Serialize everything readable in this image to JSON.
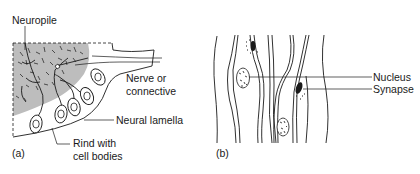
{
  "figure": {
    "panel_a": {
      "panel_label": "(a)",
      "labels": {
        "neuropile": "Neuropile",
        "nerve_line1": "Nerve or",
        "nerve_line2": "connective",
        "neural_lamella": "Neural lamella",
        "rind_line1": "Rind with",
        "rind_line2": "cell bodies"
      },
      "colors": {
        "neuropile_shading": "#bdbdbd",
        "line": "#1a1a1a"
      }
    },
    "panel_b": {
      "panel_label": "(b)",
      "labels": {
        "nucleus": "Nucleus",
        "synapse": "Synapse"
      }
    }
  }
}
